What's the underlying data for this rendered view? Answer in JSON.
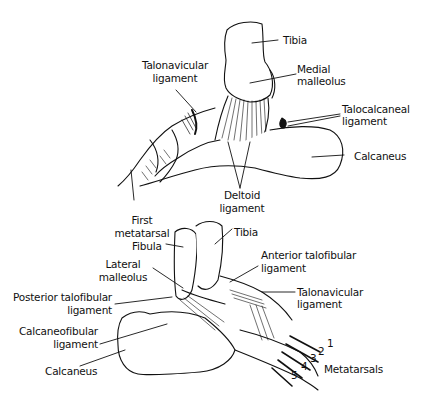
{
  "figure": {
    "top_view": {
      "title": "Medial view of ankle",
      "labels": {
        "tibia": "Tibia",
        "medial_malleolus_1": "Medial",
        "medial_malleolus_2": "malleolus",
        "talonavicular_1": "Talonavicular",
        "talonavicular_2": "ligament",
        "talocalcaneal_1": "Talocalcaneal",
        "talocalcaneal_2": "ligament",
        "calcaneus": "Calcaneus",
        "deltoid_1": "Deltoid",
        "deltoid_2": "ligament",
        "first_metatarsal_1": "First",
        "first_metatarsal_2": "metatarsal"
      }
    },
    "bottom_view": {
      "title": "Lateral view of ankle",
      "labels": {
        "fibula": "Fibula",
        "tibia": "Tibia",
        "lateral_malleolus_1": "Lateral",
        "lateral_malleolus_2": "malleolus",
        "anterior_talofibular_1": "Anterior talofibular",
        "anterior_talofibular_2": "ligament",
        "posterior_talofibular_1": "Posterior talofibular",
        "posterior_talofibular_2": "ligament",
        "talonavicular_1": "Talonavicular",
        "talonavicular_2": "ligament",
        "calcaneofibular_1": "Calcaneofibular",
        "calcaneofibular_2": "ligament",
        "calcaneus": "Calcaneus",
        "metatarsals": "Metatarsals",
        "mt1": "1",
        "mt2": "2",
        "mt3": "3",
        "mt4": "4",
        "mt5": "5"
      }
    },
    "colors": {
      "ink": "#111111",
      "background": "#ffffff"
    }
  }
}
